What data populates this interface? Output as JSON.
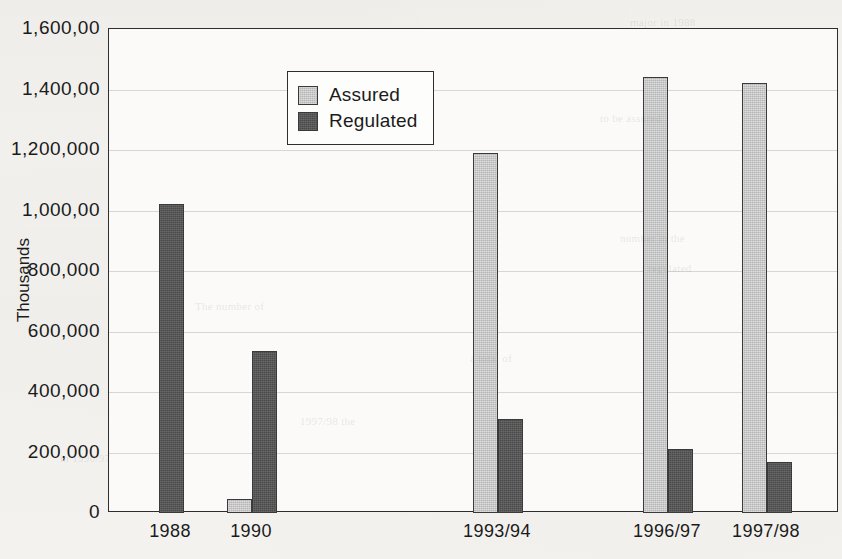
{
  "chart_data": {
    "type": "bar",
    "title": "",
    "xlabel": "",
    "ylabel": "Thousands",
    "ylim": [
      0,
      1600000
    ],
    "ytick_step": 200000,
    "ytick_labels": [
      "1,600,00",
      "1,400,00",
      "1,200,000",
      "1,000,00",
      "800,000",
      "600,000",
      "400,000",
      "200,000",
      "0"
    ],
    "ytick_values": [
      1600000,
      1400000,
      1200000,
      1000000,
      800000,
      600000,
      400000,
      200000,
      0
    ],
    "grid": true,
    "legend_position": "upper-left-inside",
    "categories": [
      "1988",
      "1990",
      "1993/94",
      "1996/97",
      "1997/98"
    ],
    "series": [
      {
        "name": "Assured",
        "color": "#b5b5b5",
        "values": [
          null,
          45000,
          1190000,
          1440000,
          1420000
        ]
      },
      {
        "name": "Regulated",
        "color": "#4a4a4a",
        "values": [
          1020000,
          535000,
          310000,
          210000,
          170000
        ]
      }
    ],
    "legend": [
      {
        "label": "Assured",
        "color": "#b5b5b5"
      },
      {
        "label": "Regulated",
        "color": "#4a4a4a"
      }
    ]
  },
  "layout": {
    "category_centers_px": [
      170,
      251,
      497,
      667,
      766
    ],
    "bar_width_px": 25,
    "plot_left_px": 108,
    "plot_top_px": 28,
    "plot_width_px": 730,
    "plot_height_px": 484
  },
  "ghost_text": [
    {
      "text": "major in 1988",
      "x": 630,
      "y": 16
    },
    {
      "text": "to be assured",
      "x": 600,
      "y": 112
    },
    {
      "text": "number in the",
      "x": 620,
      "y": 232
    },
    {
      "text": "regulated",
      "x": 648,
      "y": 262
    },
    {
      "text": "The number of",
      "x": 195,
      "y": 300
    },
    {
      "text": "a total of",
      "x": 470,
      "y": 352
    },
    {
      "text": "1997/98 the",
      "x": 300,
      "y": 415
    },
    {
      "text": "in 1996/97",
      "x": 60,
      "y": 452
    }
  ]
}
